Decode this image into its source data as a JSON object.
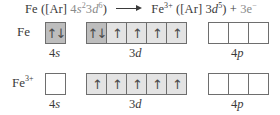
{
  "equation": {
    "reactant": "Fe",
    "reactant_core": "([Ar]",
    "reactant_config": {
      "s_n": "4",
      "s_l": "s",
      "s_e": "2",
      "d_n": "3",
      "d_l": "d",
      "d_e": "6"
    },
    "reactant_close": ")",
    "product": "Fe",
    "product_charge": "3+",
    "product_core": "([Ar]",
    "product_config": {
      "d_n": "3",
      "d_l": "d",
      "d_e": "5"
    },
    "product_close": ")",
    "plus": "+",
    "electrons": "3e",
    "electron_charge": "−"
  },
  "rows": [
    {
      "species": "Fe",
      "charge": "",
      "orbitals": {
        "4s": [
          "↑↓"
        ],
        "3d": [
          "↑↓",
          "↑",
          "↑",
          "↑",
          "↑"
        ],
        "4p": [
          "",
          "",
          ""
        ]
      }
    },
    {
      "species": "Fe",
      "charge": "3+",
      "orbitals": {
        "4s": [
          ""
        ],
        "3d": [
          "↑",
          "↑",
          "↑",
          "↑",
          "↑"
        ],
        "4p": [
          "",
          "",
          ""
        ]
      }
    }
  ],
  "labels": {
    "4s": {
      "n": "4",
      "l": "s"
    },
    "3d": {
      "n": "3",
      "l": "d"
    },
    "4p": {
      "n": "4",
      "l": "p"
    }
  },
  "colors": {
    "paired_fill": "#bdbdbd",
    "single_fill": "#e3e3e3",
    "empty_fill": "#ffffff",
    "border": "#6e6e6e"
  }
}
